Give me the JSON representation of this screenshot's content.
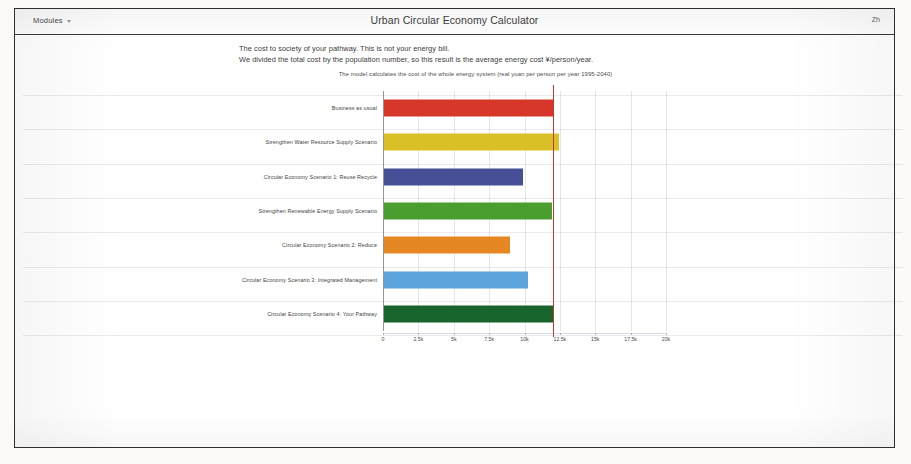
{
  "header": {
    "modules_label": "Modules",
    "menu_caret_icon": "chevron-down-icon",
    "app_title": "Urban Circular Economy Calculator",
    "language_label": "Zh"
  },
  "intro": {
    "line1": "The cost to society of your pathway.  This is not your energy bill.",
    "line2": "We divided the total cost by the population number, so this result is the average energy cost  ¥/person/year."
  },
  "chart_data": {
    "type": "bar",
    "orientation": "horizontal",
    "title": "The model calculates the cost of the whole energy system (real yuan per person per year 1995-2040)",
    "xlabel": "",
    "ylabel": "",
    "xlim": [
      0,
      20000
    ],
    "grid": true,
    "tick_labels": [
      "0",
      "2.5k",
      "5k",
      "7.5k",
      "10k",
      "12.5k",
      "15k",
      "17.5k",
      "20k"
    ],
    "tick_values": [
      0,
      2500,
      5000,
      7500,
      10000,
      12500,
      15000,
      17500,
      20000
    ],
    "reference_line": {
      "value": 12000,
      "color": "#c0392b"
    },
    "categories": [
      "Business as usual",
      "Strengthen Water Resource Supply Scenario",
      "Circular Economy Scenario 1: Reuse Recycle",
      "Strengthen Renewable Energy Supply Scenario",
      "Circular Economy Scenario 2: Reduce",
      "Circular Economy Scenario 3: Integrated Management",
      "Circular Economy Scenario 4: Your Pathway"
    ],
    "values": [
      12000,
      12350,
      9800,
      11850,
      8900,
      10200,
      12000
    ],
    "colors": [
      "#d6372a",
      "#d9c027",
      "#474f96",
      "#4a9e2f",
      "#e58722",
      "#5ba3da",
      "#17652c"
    ],
    "patterns": [
      "hatched",
      "hatched",
      "solid",
      "solid",
      "solid",
      "solid",
      "solid"
    ]
  }
}
